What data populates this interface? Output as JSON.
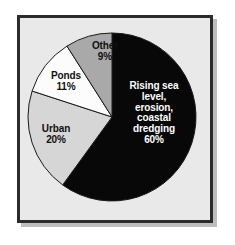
{
  "figure": {
    "frame": {
      "border_color": "#2b2b2b",
      "background_color": "#e9e9e9",
      "shadow_color": "#bdbdbd",
      "page_color": "#ffffff"
    }
  },
  "chart_data": {
    "type": "pie",
    "title": "",
    "subtitle": "",
    "xlabel": "",
    "ylabel": "",
    "legend_position": "none",
    "grid": false,
    "start_angle_deg": 0,
    "direction": "clockwise",
    "categories": [
      "Rising sea level, erosion, coastal dredging",
      "Urban",
      "Ponds",
      "Other"
    ],
    "values": [
      60,
      20,
      11,
      9
    ],
    "units": "percent",
    "total": 100,
    "slices": [
      {
        "label": "Rising sea\nlevel,\nerosion,\ncoastal\ndredging\n60%",
        "name": "Rising sea level, erosion, coastal dredging",
        "value": 60,
        "percent_text": "60%",
        "color": "#080808",
        "text_color": "#ffffff",
        "outline_color": "#1a1a1a"
      },
      {
        "label": "Urban\n20%",
        "name": "Urban",
        "value": 20,
        "percent_text": "20%",
        "color": "#d6d6d6",
        "text_color": "#101010",
        "outline_color": "#1a1a1a"
      },
      {
        "label": "Ponds\n11%",
        "name": "Ponds",
        "value": 11,
        "percent_text": "11%",
        "color": "#fcfcfc",
        "text_color": "#101010",
        "outline_color": "#1a1a1a"
      },
      {
        "label": "Other\n9%",
        "name": "Other",
        "value": 9,
        "percent_text": "9%",
        "color": "#a9a9a9",
        "text_color": "#101010",
        "outline_color": "#1a1a1a"
      }
    ],
    "geometry": {
      "center_x": 112,
      "center_y": 117,
      "radius": 84
    }
  }
}
